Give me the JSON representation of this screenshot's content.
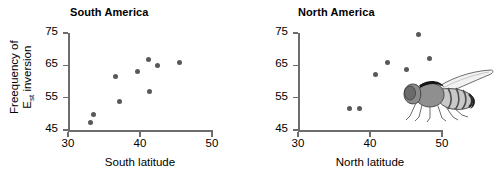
{
  "figure": {
    "y_axis_label_line1": "Freequency of",
    "y_axis_label_line2_main": "E",
    "y_axis_label_line2_sub": "st",
    "y_axis_label_line2_rest": " inversion",
    "marker_color": "#595959",
    "axis_color": "#6d6d6d",
    "fly_illustration_name": "drosophila-fly"
  },
  "chart_data": [
    {
      "type": "scatter",
      "title": "South America",
      "xlabel": "South latitude",
      "ylabel": "Freequency of Est inversion",
      "xlim": [
        30,
        50
      ],
      "ylim": [
        45,
        75
      ],
      "xticks": [
        30,
        40,
        50
      ],
      "yticks": [
        45,
        55,
        65,
        75
      ],
      "xtick_labels": [
        "30",
        "40",
        "50"
      ],
      "ytick_labels": [
        "45",
        "55",
        "65",
        "75"
      ],
      "grid": false,
      "legend": "none",
      "points": [
        {
          "x": 33.1,
          "y": 47.3
        },
        {
          "x": 33.6,
          "y": 49.7
        },
        {
          "x": 36.6,
          "y": 61.5
        },
        {
          "x": 37.2,
          "y": 53.9
        },
        {
          "x": 39.7,
          "y": 63.2
        },
        {
          "x": 41.2,
          "y": 66.9
        },
        {
          "x": 41.3,
          "y": 56.8
        },
        {
          "x": 42.4,
          "y": 64.8
        },
        {
          "x": 45.5,
          "y": 65.9
        }
      ]
    },
    {
      "type": "scatter",
      "title": "North America",
      "xlabel": "North latitude",
      "ylabel": "Freequency of Est inversion",
      "xlim": [
        30,
        50
      ],
      "ylim": [
        45,
        75
      ],
      "xticks": [
        30,
        40,
        50
      ],
      "yticks": [
        45,
        55,
        65,
        75
      ],
      "xtick_labels": [
        "30",
        "40",
        "50"
      ],
      "ytick_labels": [
        "45",
        "55",
        "65",
        "75"
      ],
      "grid": false,
      "legend": "none",
      "points": [
        {
          "x": 37.1,
          "y": 51.6
        },
        {
          "x": 38.6,
          "y": 51.7
        },
        {
          "x": 40.7,
          "y": 62.3
        },
        {
          "x": 42.4,
          "y": 66.0
        },
        {
          "x": 45.1,
          "y": 63.6
        },
        {
          "x": 46.7,
          "y": 74.5
        },
        {
          "x": 48.2,
          "y": 67.2
        }
      ]
    }
  ]
}
